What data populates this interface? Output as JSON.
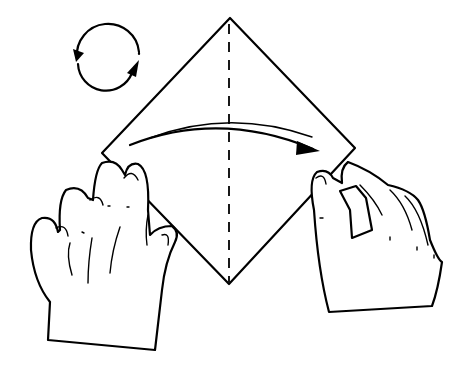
{
  "illustration": {
    "title": "Origami folding step",
    "description": "Two hands holding a square sheet of paper turned as a diamond; dashed vertical fold line; curved arrow indicating folding left corner to right; rotate symbol at upper left",
    "colors": {
      "line": "#000000",
      "background": "#ffffff"
    },
    "elements": {
      "rotate_symbol": "rotate-icon",
      "fold_line": "dashed-valley-fold-line",
      "fold_arrow": "curved-arrow-right-icon",
      "paper": "diamond-square-paper",
      "left_hand": "left-hand",
      "right_hand": "right-hand"
    }
  }
}
